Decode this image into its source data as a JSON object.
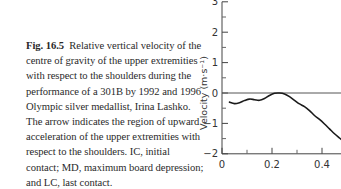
{
  "caption": {
    "figure_label": "Fig. 16.5",
    "text": "Relative vertical velocity of the centre of gravity of the upper extremities with respect to the shoulders during the performance of a 301B by 1992 and 1996 Olympic silver medallist, Irina Lashko. The arrow indicates the region of upward acceleration of the upper extremities with respect to the shoulders. IC, initial contact; MD, maximum board depression; and LC, last contact."
  },
  "chart_data": {
    "type": "line",
    "title": "",
    "xlabel": "",
    "ylabel": "Velocity (m·s⁻¹)",
    "xlim": [
      0,
      0.48
    ],
    "ylim": [
      -2,
      3
    ],
    "x_ticks": [
      "0",
      "0.2",
      "0.4"
    ],
    "x_minor_ticks": [
      0.1,
      0.3
    ],
    "y_ticks": [
      "3",
      "2",
      "1",
      "0",
      "−1",
      "−2"
    ],
    "y_minor_ticks": [
      2.5,
      1.5,
      0.5,
      -0.5,
      -1.5
    ],
    "zero_line": true,
    "grid": false,
    "series": [
      {
        "name": "Relative vertical velocity",
        "x": [
          0.03,
          0.05,
          0.07,
          0.09,
          0.11,
          0.13,
          0.15,
          0.17,
          0.19,
          0.21,
          0.23,
          0.25,
          0.27,
          0.29,
          0.31,
          0.33,
          0.35,
          0.37,
          0.39,
          0.41,
          0.43,
          0.45,
          0.47,
          0.48
        ],
        "values": [
          -0.3,
          -0.35,
          -0.32,
          -0.25,
          -0.2,
          -0.22,
          -0.24,
          -0.18,
          -0.08,
          -0.01,
          0.0,
          -0.03,
          -0.12,
          -0.24,
          -0.36,
          -0.45,
          -0.58,
          -0.74,
          -0.87,
          -1.02,
          -1.18,
          -1.34,
          -1.48,
          -1.55
        ]
      }
    ]
  }
}
